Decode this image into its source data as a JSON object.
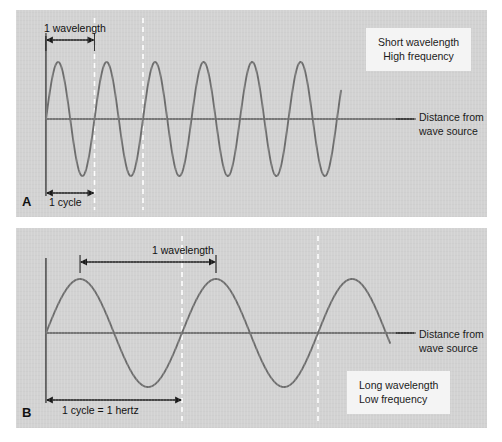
{
  "figure": {
    "background_color": "#ffffff",
    "panel_background_color": "#d2d2d2",
    "wave_color": "#6e6e6e",
    "axis_color": "#1a1a1a",
    "dashed_marker_color": "#ffffff",
    "callout_background_color": "#f4f4f4"
  },
  "panel_a": {
    "letter": "A",
    "axis_label_line1": "Distance from",
    "axis_label_line2": "wave source",
    "callout_line1": "Short wavelength",
    "callout_line2": "High frequency",
    "wavelength_label": "1 wavelength",
    "cycle_label": "1 cycle"
  },
  "panel_b": {
    "letter": "B",
    "axis_label_line1": "Distance from",
    "axis_label_line2": "wave source",
    "callout_line1": "Long wavelength",
    "callout_line2": "Low frequency",
    "wavelength_label": "1 wavelength",
    "cycle_label": "1 cycle = 1 hertz"
  },
  "chart_data": {
    "type": "line",
    "title": "",
    "xlabel": "Distance from wave source",
    "ylabel": "",
    "grid": false,
    "legend_position": "none",
    "panels": [
      {
        "id": "A",
        "description": "Short wavelength, high frequency sine wave",
        "waveform": "sine",
        "cycles": 6,
        "wavelength_px": 48.5,
        "amplitude_px": 57,
        "phase": 0,
        "x_start_px": 46,
        "x_end_px": 341,
        "baseline_y_px": 119,
        "annotations": [
          {
            "label": "1 wavelength",
            "x_start_px": 46,
            "x_end_px": 94.5,
            "y_px": 40
          },
          {
            "label": "1 cycle",
            "x_start_px": 46,
            "x_end_px": 94.5,
            "y_px": 193
          }
        ],
        "dashed_markers_px": [
          94.5,
          143
        ]
      },
      {
        "id": "B",
        "description": "Long wavelength, low frequency sine wave",
        "waveform": "sine",
        "cycles": 2.5,
        "wavelength_px": 136,
        "amplitude_px": 54,
        "phase": 0,
        "x_start_px": 46,
        "x_end_px": 390,
        "baseline_y_px": 333,
        "annotations": [
          {
            "label": "1 wavelength",
            "x_start_px": 80,
            "x_end_px": 216,
            "y_px": 262
          },
          {
            "label": "1 cycle = 1 hertz",
            "x_start_px": 46,
            "x_end_px": 182,
            "y_px": 400
          }
        ],
        "dashed_markers_px": [
          182,
          318
        ]
      }
    ]
  }
}
